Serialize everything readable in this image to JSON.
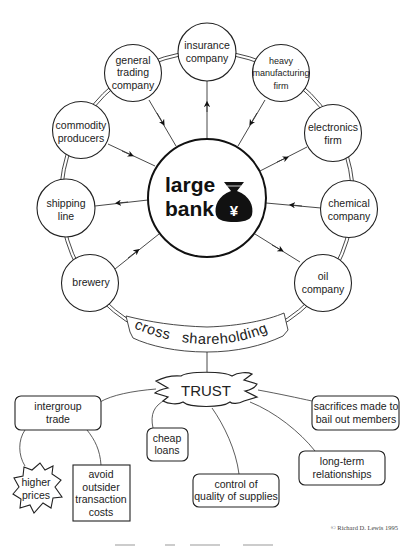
{
  "diagram": {
    "center": {
      "label_line1": "large",
      "label_line2": "bank",
      "icon": "money-bag-yen-icon"
    },
    "ring_nodes": [
      {
        "id": "insurance",
        "lines": [
          "insurance",
          "company"
        ],
        "arrow": "to-node"
      },
      {
        "id": "general-trading",
        "lines": [
          "general",
          "trading",
          "company"
        ],
        "arrow": "to-bank"
      },
      {
        "id": "heavy-manufacturing",
        "lines": [
          "heavy",
          "manufacturing",
          "firm"
        ],
        "arrow": "to-bank"
      },
      {
        "id": "commodity",
        "lines": [
          "commodity",
          "producers"
        ],
        "arrow": "to-bank"
      },
      {
        "id": "electronics",
        "lines": [
          "electronics",
          "firm"
        ],
        "arrow": "to-node"
      },
      {
        "id": "shipping",
        "lines": [
          "shipping",
          "line"
        ],
        "arrow": "to-node"
      },
      {
        "id": "chemical",
        "lines": [
          "chemical",
          "company"
        ],
        "arrow": "to-bank"
      },
      {
        "id": "brewery",
        "lines": [
          "brewery"
        ],
        "arrow": "to-bank"
      },
      {
        "id": "oil",
        "lines": [
          "oil",
          "company"
        ],
        "arrow": "to-node"
      }
    ],
    "banner": {
      "word1": "cross",
      "word2": "shareholding"
    },
    "trust": {
      "label": "TRUST"
    },
    "outcomes": [
      {
        "id": "intergroup",
        "lines": [
          "intergroup",
          "trade"
        ]
      },
      {
        "id": "cheap-loans",
        "lines": [
          "cheap",
          "loans"
        ]
      },
      {
        "id": "control-quality",
        "lines": [
          "control of",
          "quality of supplies"
        ]
      },
      {
        "id": "long-term",
        "lines": [
          "long-term",
          "relationships"
        ]
      },
      {
        "id": "sacrifices",
        "lines": [
          "sacrifices made to",
          "bail out members"
        ]
      },
      {
        "id": "higher-prices",
        "lines": [
          "higher",
          "prices"
        ]
      },
      {
        "id": "avoid-costs",
        "lines": [
          "avoid",
          "outsider",
          "transaction",
          "costs"
        ]
      }
    ],
    "copyright": "© Richard D. Lewis 1995"
  }
}
